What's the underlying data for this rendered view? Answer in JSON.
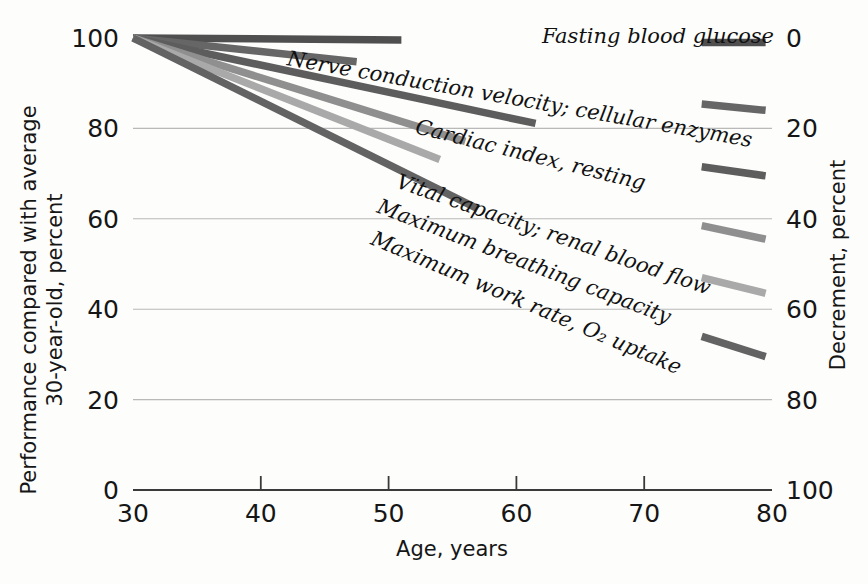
{
  "chart_data": {
    "type": "line",
    "title": "",
    "xlabel": "Age, years",
    "ylabel": "Performance compared with average 30-year-old, percent",
    "y2label": "Decrement, percent",
    "xlim": [
      30,
      80
    ],
    "ylim": [
      0,
      100
    ],
    "y2lim": [
      0,
      100
    ],
    "grid": true,
    "legend_position": "inline-right-of-line",
    "x_ticks": [
      "30",
      "40",
      "50",
      "60",
      "70",
      "80"
    ],
    "x_tick_values": [
      30,
      40,
      50,
      60,
      70,
      80
    ],
    "y_ticks": [
      "0",
      "20",
      "40",
      "60",
      "80",
      "100"
    ],
    "y_tick_values": [
      0,
      20,
      40,
      60,
      80,
      100
    ],
    "y2_ticks": [
      "0",
      "20",
      "40",
      "60",
      "80",
      "100"
    ],
    "y2_tick_values": [
      0,
      20,
      40,
      60,
      80,
      100
    ],
    "series": [
      {
        "name": "Fasting blood glucose",
        "color": "#4f4f4f",
        "x": [
          30,
          80
        ],
        "values": [
          100,
          99
        ],
        "label_x": 62,
        "label_y": 99,
        "label_rotation": 0,
        "line_break_x": 51,
        "stub_x0": 74.5,
        "stub_y0": 99,
        "stub_x1": 79.5,
        "stub_y1": 99
      },
      {
        "name": "Nerve conduction velocity; cellular enzymes",
        "color": "#666666",
        "x": [
          30,
          80
        ],
        "values": [
          100,
          85
        ],
        "label_x": 42,
        "label_y": 94,
        "label_rotation": 10,
        "line_break_x": 47.5,
        "stub_x0": 74.5,
        "stub_y0": 85.4,
        "stub_x1": 79.5,
        "stub_y1": 84
      },
      {
        "name": "Cardiac index, resting",
        "color": "#5d5d5d",
        "x": [
          30,
          80
        ],
        "values": [
          100,
          70
        ],
        "label_x": 52,
        "label_y": 79,
        "label_rotation": 14,
        "line_break_x": 61.5,
        "stub_x0": 74.5,
        "stub_y0": 71.5,
        "stub_x1": 79.5,
        "stub_y1": 69.5
      },
      {
        "name": "Vital capacity; renal blood flow",
        "color": "#8f8f8f",
        "x": [
          30,
          80
        ],
        "values": [
          100,
          56
        ],
        "label_x": 50.5,
        "label_y": 67,
        "label_rotation": 19,
        "line_break_x": 56,
        "stub_x0": 74.5,
        "stub_y0": 58.5,
        "stub_x1": 79.5,
        "stub_y1": 55.5
      },
      {
        "name": "Maximum breathing capacity",
        "color": "#a9a9a9",
        "x": [
          30,
          80
        ],
        "values": [
          100,
          44
        ],
        "label_x": 49,
        "label_y": 61.5,
        "label_rotation": 21,
        "line_break_x": 54,
        "stub_x0": 74.5,
        "stub_y0": 47,
        "stub_x1": 79.5,
        "stub_y1": 43.5
      },
      {
        "name": "Maximum work rate, O₂ uptake",
        "color": "#636363",
        "x": [
          30,
          80
        ],
        "values": [
          100,
          30
        ],
        "label_x": 48.5,
        "label_y": 54.5,
        "label_rotation": 23,
        "line_break_x": 57,
        "stub_x0": 74.5,
        "stub_y0": 34,
        "stub_x1": 79.5,
        "stub_y1": 29.5
      }
    ]
  },
  "axes": {
    "left_title": "Performance compared with average 30-year-old, percent",
    "right_title": "Decrement, percent",
    "bottom_title": "Age, years"
  },
  "colors": {
    "background": "#fdfdfc",
    "axis": "#3a3a3a",
    "grid": "#b9b9b9",
    "text": "#161616"
  }
}
